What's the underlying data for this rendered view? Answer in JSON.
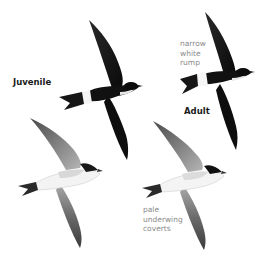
{
  "labels": {
    "juvenile": "Juvenile",
    "adult": "Adult",
    "rump_note": [
      "narrow",
      "white",
      "rump"
    ],
    "underwing_note": [
      "pale",
      "underwing",
      "coverts"
    ]
  },
  "colors": {
    "background": "#ffffff",
    "upperparts": "#111111",
    "underwing_dark": "#3a3a3a",
    "underwing_light": "#9a9a9a",
    "underparts": "#f2f2f2",
    "note_text": "#8a8a8a",
    "label_text": "#1a1a1a"
  },
  "birds": [
    {
      "name": "juvenile-upperside",
      "view": "upperside"
    },
    {
      "name": "adult-upperside",
      "view": "upperside"
    },
    {
      "name": "juvenile-underside",
      "view": "underside"
    },
    {
      "name": "adult-underside",
      "view": "underside"
    }
  ]
}
